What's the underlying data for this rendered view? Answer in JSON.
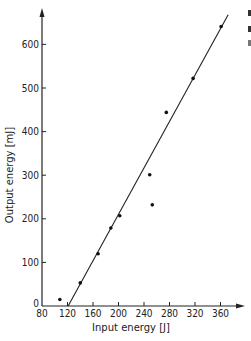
{
  "chart_data": {
    "type": "scatter",
    "title": "",
    "xlabel": "Input energy [J]",
    "ylabel": "Output energy [mJ]",
    "xlim": [
      80,
      390
    ],
    "ylim": [
      0,
      680
    ],
    "x_ticks": [
      80,
      120,
      160,
      200,
      240,
      280,
      320,
      360
    ],
    "y_ticks": [
      0,
      100,
      200,
      300,
      400,
      500,
      600
    ],
    "x_tick_labels": [
      "80",
      "120",
      "160",
      "200",
      "240",
      "280",
      "320",
      "360"
    ],
    "y_tick_labels": [
      "0",
      "100",
      "200",
      "300",
      "400",
      "500",
      "600"
    ],
    "grid": false,
    "legend": null,
    "series": [
      {
        "name": "measured",
        "type": "scatter",
        "x": [
          108,
          140,
          168,
          188,
          202,
          249,
          253,
          275,
          317,
          361
        ],
        "y": [
          15,
          53,
          120,
          179,
          207,
          301,
          232,
          444,
          522,
          641
        ]
      },
      {
        "name": "linear fit",
        "type": "line",
        "x": [
          121,
          372
        ],
        "y": [
          0,
          668
        ]
      }
    ]
  }
}
